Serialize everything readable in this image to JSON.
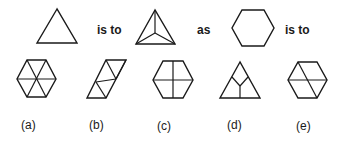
{
  "analogy": {
    "connector_1": "is to",
    "connector_2": "as",
    "connector_3": "is to"
  },
  "figures": {
    "top": [
      {
        "id": "triangle",
        "description": "plain equilateral triangle"
      },
      {
        "id": "triangle-divided",
        "description": "triangle with lines from center to each vertex"
      },
      {
        "id": "hexagon",
        "description": "plain regular hexagon"
      }
    ]
  },
  "options": [
    {
      "label": "(a)",
      "description": "hexagon divided into six triangles by three diagonals"
    },
    {
      "label": "(b)",
      "description": "parallelogram divided into triangles"
    },
    {
      "label": "(c)",
      "description": "hexagon divided by a vertical and horizontal line"
    },
    {
      "label": "(d)",
      "description": "triangle with Y-shaped divider from center"
    },
    {
      "label": "(e)",
      "description": "hexagon divided by a horizontal line and one diagonal"
    }
  ]
}
